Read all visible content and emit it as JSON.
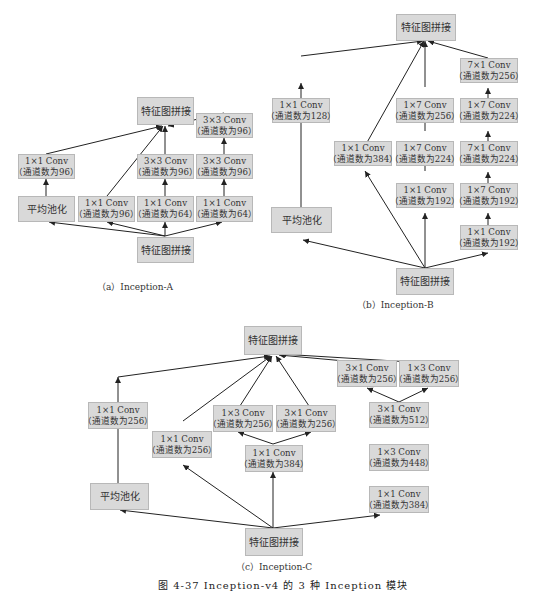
{
  "figure_caption": "图 4-37  Inception-v4 的 3 种 Inception 模块",
  "diagrams": {
    "a": {
      "caption": "（a）Inception-A",
      "top": "特征图拼接",
      "bottom": "特征图拼接",
      "pool": "平均池化",
      "pool_conv": [
        "1×1 Conv",
        "（通道数为96）"
      ],
      "b1": [
        "1×1 Conv",
        "（通道数为96）"
      ],
      "b2_top": [
        "3×3 Conv",
        "（通道数为96）"
      ],
      "b2_bot": [
        "1×1 Conv",
        "（通道数为64）"
      ],
      "b3_top": [
        "3×3 Conv",
        "（通道数为96）"
      ],
      "b3_mid": [
        "3×3 Conv",
        "（通道数为96）"
      ],
      "b3_bot": [
        "1×1 Conv",
        "（通道数为64）"
      ]
    },
    "b": {
      "caption": "（b）Inception-B",
      "top": "特征图拼接",
      "bottom": "特征图拼接",
      "pool": "平均池化",
      "pool_conv": [
        "1×1 Conv",
        "（通道数为128）"
      ],
      "b1": [
        "1×1 Conv",
        "（通道数为384）"
      ],
      "b2_top": [
        "1×7 Conv",
        "（通道数为256）"
      ],
      "b2_mid": [
        "1×7 Conv",
        "（通道数为224）"
      ],
      "b2_bot": [
        "1×1 Conv",
        "（通道数为192）"
      ],
      "b3_1": [
        "7×1 Conv",
        "（通道数为256）"
      ],
      "b3_2": [
        "1×7 Conv",
        "（通道数为224）"
      ],
      "b3_3": [
        "7×1 Conv",
        "（通道数为224）"
      ],
      "b3_4": [
        "1×7 Conv",
        "（通道数为192）"
      ],
      "b3_5": [
        "1×1 Conv",
        "（通道数为192）"
      ]
    },
    "c": {
      "caption": "（c）Inception-C",
      "top": "特征图拼接",
      "bottom": "特征图拼接",
      "pool": "平均池化",
      "pool_conv": [
        "1×1 Conv",
        "（通道数为256）"
      ],
      "b1": [
        "1×1 Conv",
        "（通道数为256）"
      ],
      "b2_left": [
        "1×3 Conv",
        "（通道数为256）"
      ],
      "b2_right": [
        "3×1 Conv",
        "（通道数为256）"
      ],
      "b2_bot": [
        "1×1 Conv",
        "（通道数为384）"
      ],
      "b3_left": [
        "3×1 Conv",
        "（通道数为256）"
      ],
      "b3_right": [
        "1×3 Conv",
        "（通道数为256）"
      ],
      "b3_mid": [
        "3×1 Conv",
        "（通道数为512）"
      ],
      "b3_mid2": [
        "1×3 Conv",
        "（通道数为448）"
      ],
      "b3_bot": [
        "1×1 Conv",
        "（通道数为384）"
      ]
    }
  },
  "colors": {
    "box_fill": "#d9d9d9",
    "box_border": "#b8b8b8",
    "line": "#222222"
  }
}
